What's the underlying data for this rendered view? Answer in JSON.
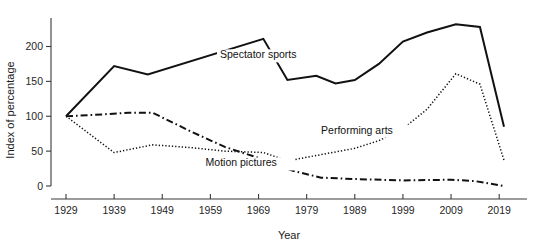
{
  "chart_data": {
    "type": "line",
    "title": "",
    "xlabel": "Year",
    "ylabel": "Index of percentage",
    "xlim": [
      1929,
      2020
    ],
    "ylim": [
      0,
      235
    ],
    "grid": false,
    "legend_position": "inline-labels",
    "x_ticks": [
      "1929",
      "1939",
      "1949",
      "1959",
      "1969",
      "1979",
      "1989",
      "1999",
      "2009",
      "2019"
    ],
    "x_tick_values": [
      1929,
      1939,
      1949,
      1959,
      1969,
      1979,
      1989,
      1999,
      2009,
      2019
    ],
    "y_ticks": [
      "0",
      "50",
      "100",
      "150",
      "200"
    ],
    "y_tick_values": [
      0,
      50,
      100,
      150,
      200
    ],
    "series": [
      {
        "name": "Spectator sports",
        "style": "solid",
        "label_x": 1961,
        "label_y": 183,
        "x": [
          1929,
          1939,
          1946,
          1970,
          1975,
          1981,
          1985,
          1989,
          1994,
          1999,
          2004,
          2010,
          2015,
          2020
        ],
        "values": [
          100,
          172,
          160,
          211,
          152,
          158,
          147,
          152,
          175,
          207,
          220,
          232,
          228,
          85
        ]
      },
      {
        "name": "Performing arts",
        "style": "dotted",
        "label_x": 1982,
        "label_y": 75,
        "x": [
          1929,
          1939,
          1947,
          1955,
          1962,
          1970,
          1975,
          1982,
          1989,
          1994,
          1999,
          2004,
          2010,
          2015,
          2020
        ],
        "values": [
          100,
          48,
          59,
          55,
          50,
          48,
          36,
          45,
          54,
          65,
          82,
          110,
          161,
          146,
          37
        ]
      },
      {
        "name": "Motion pictures",
        "style": "dashdot",
        "label_x": 1958,
        "label_y": 28,
        "x": [
          1929,
          1935,
          1942,
          1947,
          1955,
          1962,
          1970,
          1976,
          1982,
          1989,
          1999,
          2009,
          2014,
          2020
        ],
        "values": [
          100,
          102,
          105,
          105,
          78,
          56,
          38,
          22,
          12,
          10,
          8,
          9,
          7,
          0
        ]
      }
    ]
  },
  "axis": {
    "x_title": "Year",
    "y_title": "Index of percentage"
  }
}
